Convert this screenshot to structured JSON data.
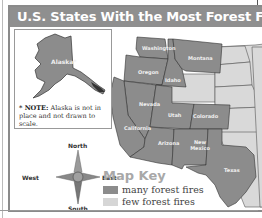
{
  "title": "U.S. States With the Most Forest Fires",
  "inset": {
    "label": "Alaska*",
    "note_bold": "* NOTE:",
    "note_text": " Alaska is not in place and not drawn to scale."
  },
  "states": {
    "washington": "Washington",
    "oregon": "Oregon",
    "idaho": "Idaho",
    "montana": "Montana",
    "nevada": "Nevada",
    "california": "California",
    "utah": "Utah",
    "colorado": "Colorado",
    "arizona": "Arizona",
    "new_mexico": "New Mexico",
    "texas": "Texas"
  },
  "compass": {
    "north": "North",
    "south": "South",
    "east": "East",
    "west": "West"
  },
  "key": {
    "title": "Map Key",
    "items": [
      {
        "label": "many forest fires",
        "color": "#8c8c8c"
      },
      {
        "label": "few forest fires",
        "color": "#d6d6d6"
      }
    ]
  },
  "colors": {
    "many": "#8c8c8c",
    "few": "#d9d9d9",
    "title_bar": "#8f8f8f",
    "key_title": "#a8a8a8"
  }
}
